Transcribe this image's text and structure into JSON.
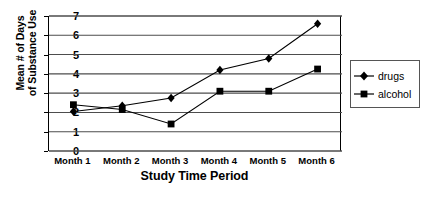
{
  "chart_data": {
    "type": "line",
    "title": "",
    "xlabel": "Study Time Period",
    "ylabel_line1": "Mean # of Days",
    "ylabel_line2": "of Substance Use",
    "categories": [
      "Month 1",
      "Month 2",
      "Month 3",
      "Month 4",
      "Month 5",
      "Month 6"
    ],
    "yticks": [
      0,
      1,
      2,
      3,
      4,
      5,
      6,
      7
    ],
    "ylim": [
      0,
      7
    ],
    "grid": true,
    "legend_position": "right-outside",
    "series": [
      {
        "name": "drugs",
        "marker": "diamond",
        "color": "#000000",
        "values": [
          2.05,
          2.35,
          2.75,
          4.2,
          4.8,
          6.6
        ]
      },
      {
        "name": "alcohol",
        "marker": "square",
        "color": "#000000",
        "values": [
          2.4,
          2.15,
          1.4,
          3.1,
          3.1,
          4.25
        ]
      }
    ]
  },
  "legend": {
    "entries": [
      {
        "label": "drugs"
      },
      {
        "label": "alcohol"
      }
    ]
  },
  "caption": {
    "text": ""
  }
}
